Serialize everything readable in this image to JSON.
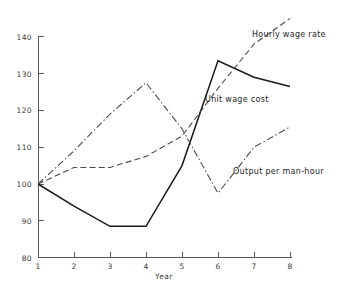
{
  "chart_data": {
    "type": "line",
    "title": "",
    "subtitle": "",
    "xlabel": "Year",
    "ylabel": "",
    "x": [
      1,
      2,
      3,
      4,
      5,
      6,
      7,
      8
    ],
    "xtick_labels": [
      "1",
      "2",
      "3",
      "4",
      "5",
      "6",
      "7",
      "8"
    ],
    "ytick_labels": [
      "80",
      "90",
      "100",
      "110",
      "120",
      "130",
      "140"
    ],
    "yticks": [
      80,
      90,
      100,
      110,
      120,
      130,
      140
    ],
    "xlim": [
      1,
      8
    ],
    "ylim": [
      80,
      140
    ],
    "grid": false,
    "legend_position": "inline-annotations",
    "series": [
      {
        "name": "Unit wage cost",
        "style": "solid",
        "color": "#1a1a1a",
        "values": [
          100,
          94,
          88.5,
          88.5,
          105,
          133.5,
          129,
          126.5
        ],
        "annotation": {
          "text": "Unit wage cost",
          "x_px": 205,
          "y_px": 95
        }
      },
      {
        "name": "Hourly wage rate",
        "style": "dashed",
        "color": "#4a4a4a",
        "values": [
          100,
          104.5,
          104.5,
          107.5,
          113,
          126,
          138,
          145
        ],
        "annotation": {
          "text": "Hourly wage rate",
          "x_px": 252,
          "y_px": 30
        }
      },
      {
        "name": "Output per man-hour",
        "style": "dash-dot",
        "color": "#4a4a4a",
        "values": [
          100,
          109,
          119,
          127.5,
          115,
          97.5,
          110,
          115.5
        ],
        "annotation": {
          "text": "Output per man-hour",
          "x_px": 233,
          "y_px": 167
        }
      }
    ]
  },
  "axes": {
    "x_axis_title": "Year",
    "y_axis_title": ""
  }
}
